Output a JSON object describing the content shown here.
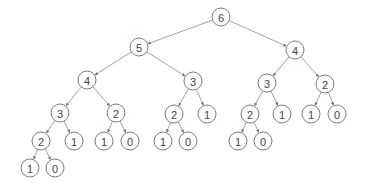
{
  "diagram": {
    "type": "tree",
    "node_radius": 9,
    "colors": {
      "edge": "#8a8a8a",
      "node_stroke": "#6e6e6e",
      "text": "#444444",
      "background": "#ffffff"
    },
    "nodes": [
      {
        "id": "n0",
        "label": "6",
        "x": 221,
        "y": 17
      },
      {
        "id": "n1",
        "label": "5",
        "x": 139,
        "y": 47
      },
      {
        "id": "n2",
        "label": "4",
        "x": 295,
        "y": 50
      },
      {
        "id": "n3",
        "label": "4",
        "x": 87,
        "y": 80
      },
      {
        "id": "n4",
        "label": "3",
        "x": 193,
        "y": 81
      },
      {
        "id": "n5",
        "label": "3",
        "x": 267,
        "y": 83
      },
      {
        "id": "n6",
        "label": "2",
        "x": 325,
        "y": 84
      },
      {
        "id": "n7",
        "label": "3",
        "x": 60,
        "y": 113
      },
      {
        "id": "n8",
        "label": "2",
        "x": 116,
        "y": 113
      },
      {
        "id": "n9",
        "label": "2",
        "x": 174,
        "y": 114
      },
      {
        "id": "n10",
        "label": "1",
        "x": 207,
        "y": 114
      },
      {
        "id": "n11",
        "label": "2",
        "x": 250,
        "y": 114
      },
      {
        "id": "n12",
        "label": "1",
        "x": 282,
        "y": 114
      },
      {
        "id": "n13",
        "label": "1",
        "x": 311,
        "y": 114
      },
      {
        "id": "n14",
        "label": "0",
        "x": 337,
        "y": 114
      },
      {
        "id": "n15",
        "label": "2",
        "x": 41,
        "y": 141
      },
      {
        "id": "n16",
        "label": "1",
        "x": 74,
        "y": 141
      },
      {
        "id": "n17",
        "label": "1",
        "x": 104,
        "y": 141
      },
      {
        "id": "n18",
        "label": "0",
        "x": 130,
        "y": 141
      },
      {
        "id": "n19",
        "label": "1",
        "x": 163,
        "y": 141
      },
      {
        "id": "n20",
        "label": "0",
        "x": 188,
        "y": 141
      },
      {
        "id": "n21",
        "label": "1",
        "x": 238,
        "y": 141
      },
      {
        "id": "n22",
        "label": "0",
        "x": 263,
        "y": 141
      },
      {
        "id": "n23",
        "label": "1",
        "x": 30,
        "y": 168
      },
      {
        "id": "n24",
        "label": "0",
        "x": 55,
        "y": 168
      }
    ],
    "edges": [
      [
        "n0",
        "n1"
      ],
      [
        "n0",
        "n2"
      ],
      [
        "n1",
        "n3"
      ],
      [
        "n1",
        "n4"
      ],
      [
        "n2",
        "n5"
      ],
      [
        "n2",
        "n6"
      ],
      [
        "n3",
        "n7"
      ],
      [
        "n3",
        "n8"
      ],
      [
        "n4",
        "n9"
      ],
      [
        "n4",
        "n10"
      ],
      [
        "n5",
        "n11"
      ],
      [
        "n5",
        "n12"
      ],
      [
        "n6",
        "n13"
      ],
      [
        "n6",
        "n14"
      ],
      [
        "n7",
        "n15"
      ],
      [
        "n7",
        "n16"
      ],
      [
        "n8",
        "n17"
      ],
      [
        "n8",
        "n18"
      ],
      [
        "n9",
        "n19"
      ],
      [
        "n9",
        "n20"
      ],
      [
        "n11",
        "n21"
      ],
      [
        "n11",
        "n22"
      ],
      [
        "n15",
        "n23"
      ],
      [
        "n15",
        "n24"
      ]
    ]
  }
}
